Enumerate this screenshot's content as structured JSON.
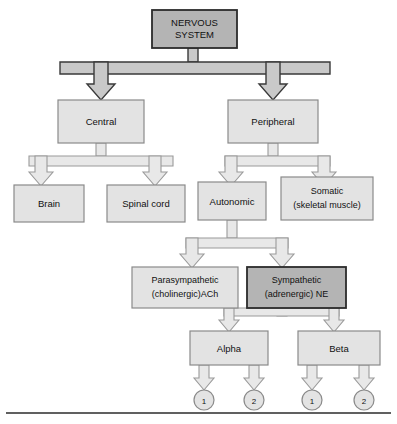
{
  "diagram": {
    "type": "hierarchy-flowchart",
    "colors": {
      "box_light_fill": "#e3e3e3",
      "box_dark_fill": "#b4b4b4",
      "box_light_stroke": "#8a8a8a",
      "box_dark_stroke": "#2b2b2b",
      "arrow_light_fill": "#e8e8e8",
      "arrow_light_stroke": "#9a9a9a",
      "arrow_dark_fill": "#c9c9c9",
      "arrow_dark_stroke": "#3a3a3a",
      "text": "#111111",
      "rule": "#2b2b2b"
    },
    "nodes": {
      "root": {
        "id": "nervous-system",
        "lines": [
          "NERVOUS",
          "SYSTEM"
        ],
        "style": "dark",
        "level": 0
      },
      "central": {
        "id": "central",
        "lines": [
          "Central"
        ],
        "style": "light",
        "level": 1
      },
      "peripheral": {
        "id": "peripheral",
        "lines": [
          "Peripheral"
        ],
        "style": "light",
        "level": 1
      },
      "brain": {
        "id": "brain",
        "lines": [
          "Brain"
        ],
        "style": "light",
        "level": 2
      },
      "spinal_cord": {
        "id": "spinal-cord",
        "lines": [
          "Spinal cord"
        ],
        "style": "light",
        "level": 2
      },
      "autonomic": {
        "id": "autonomic",
        "lines": [
          "Autonomic"
        ],
        "style": "light",
        "level": 2
      },
      "somatic": {
        "id": "somatic",
        "lines": [
          "Somatic",
          "(skeletal muscle)"
        ],
        "style": "light",
        "level": 2
      },
      "parasympathetic": {
        "id": "parasympathetic",
        "lines": [
          "Parasympathetic",
          "(cholinergic)ACh"
        ],
        "style": "light",
        "level": 3
      },
      "sympathetic": {
        "id": "sympathetic",
        "lines": [
          "Sympathetic",
          "(adrenergic) NE"
        ],
        "style": "dark",
        "level": 3
      },
      "alpha": {
        "id": "alpha",
        "lines": [
          "Alpha"
        ],
        "style": "light",
        "level": 4
      },
      "beta": {
        "id": "beta",
        "lines": [
          "Beta"
        ],
        "style": "light",
        "level": 4
      },
      "alpha_1": {
        "id": "alpha-1",
        "lines": [
          "1"
        ],
        "style": "circle",
        "level": 5
      },
      "alpha_2": {
        "id": "alpha-2",
        "lines": [
          "2"
        ],
        "style": "circle",
        "level": 5
      },
      "beta_1": {
        "id": "beta-1",
        "lines": [
          "1"
        ],
        "style": "circle",
        "level": 5
      },
      "beta_2": {
        "id": "beta-2",
        "lines": [
          "2"
        ],
        "style": "circle",
        "level": 5
      }
    },
    "edges": [
      {
        "from": "nervous-system",
        "to": "central",
        "arrow": "dark"
      },
      {
        "from": "nervous-system",
        "to": "peripheral",
        "arrow": "dark"
      },
      {
        "from": "central",
        "to": "brain",
        "arrow": "light"
      },
      {
        "from": "central",
        "to": "spinal-cord",
        "arrow": "light"
      },
      {
        "from": "peripheral",
        "to": "autonomic",
        "arrow": "light"
      },
      {
        "from": "peripheral",
        "to": "somatic",
        "arrow": "light"
      },
      {
        "from": "autonomic",
        "to": "parasympathetic",
        "arrow": "light"
      },
      {
        "from": "autonomic",
        "to": "sympathetic",
        "arrow": "light"
      },
      {
        "from": "sympathetic",
        "to": "alpha",
        "arrow": "light"
      },
      {
        "from": "sympathetic",
        "to": "beta",
        "arrow": "light"
      },
      {
        "from": "alpha",
        "to": "alpha-1",
        "arrow": "light"
      },
      {
        "from": "alpha",
        "to": "alpha-2",
        "arrow": "light"
      },
      {
        "from": "beta",
        "to": "beta-1",
        "arrow": "light"
      },
      {
        "from": "beta",
        "to": "beta-2",
        "arrow": "light"
      }
    ],
    "footer_rule": {
      "present": true
    }
  },
  "labels": {
    "nervous_system_line1": "NERVOUS",
    "nervous_system_line2": "SYSTEM",
    "central": "Central",
    "peripheral": "Peripheral",
    "brain": "Brain",
    "spinal_cord": "Spinal cord",
    "autonomic": "Autonomic",
    "somatic_line1": "Somatic",
    "somatic_line2": "(skeletal muscle)",
    "parasympathetic_line1": "Parasympathetic",
    "parasympathetic_line2": "(cholinergic)ACh",
    "sympathetic_line1": "Sympathetic",
    "sympathetic_line2": "(adrenergic) NE",
    "alpha": "Alpha",
    "beta": "Beta",
    "alpha_one": "1",
    "alpha_two": "2",
    "beta_one": "1",
    "beta_two": "2"
  }
}
